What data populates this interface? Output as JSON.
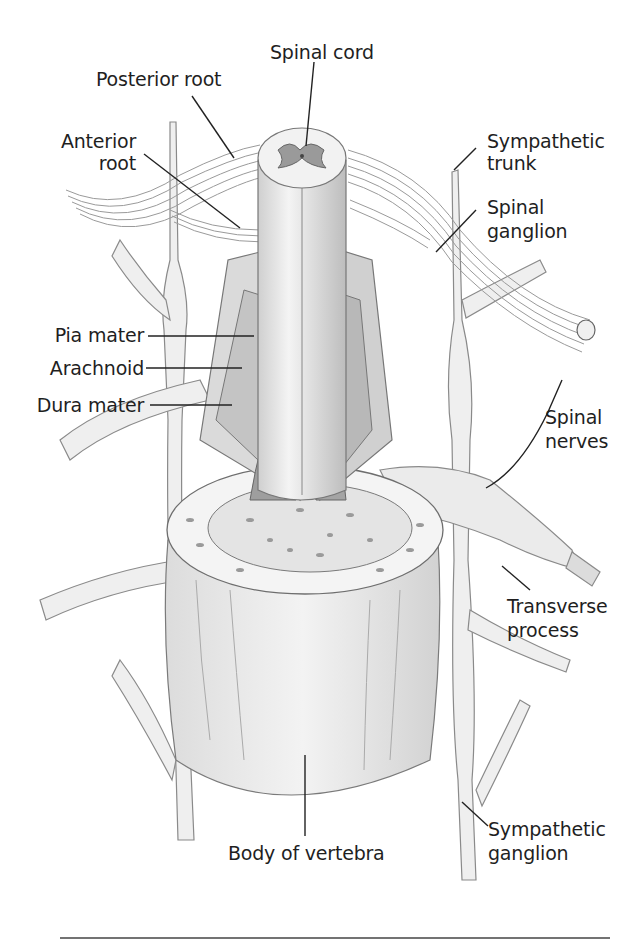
{
  "figure": {
    "labels": {
      "spinal_cord": "Spinal cord",
      "posterior_root": "Posterior root",
      "anterior_root_line1": "Anterior",
      "anterior_root_line2": "root",
      "sympathetic_trunk_line1": "Sympathetic",
      "sympathetic_trunk_line2": "trunk",
      "spinal_ganglion_line1": "Spinal",
      "spinal_ganglion_line2": "ganglion",
      "pia_mater": "Pia mater",
      "arachnoid": "Arachnoid",
      "dura_mater": "Dura mater",
      "spinal_nerves_line1": "Spinal",
      "spinal_nerves_line2": "nerves",
      "transverse_process_line1": "Transverse",
      "transverse_process_line2": "process",
      "body_of_vertebra": "Body of vertebra",
      "sympathetic_ganglion_line1": "Sympathetic",
      "sympathetic_ganglion_line2": "ganglion"
    },
    "colors": {
      "line": "#222222",
      "fill_light": "#ececec",
      "fill_mid": "#d6d6d6",
      "fill_dark": "#9a9a9a",
      "outline": "#888888"
    }
  }
}
